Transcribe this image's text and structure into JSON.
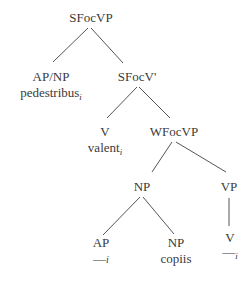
{
  "tree": {
    "root": {
      "label": "SFocVP"
    },
    "ap_np": {
      "label": "AP/NP",
      "word": "pedestribus",
      "index": "i"
    },
    "sfocv_bar": {
      "label": "SFocV'"
    },
    "v_upper": {
      "label": "V",
      "word": "valent",
      "index": "i"
    },
    "wfocvp": {
      "label": "WFocVP"
    },
    "np_mid": {
      "label": "NP"
    },
    "vp_right": {
      "label": "VP"
    },
    "ap_low": {
      "label": "AP",
      "trace": "—",
      "index": "i"
    },
    "np_low": {
      "label": "NP",
      "word": "copiis"
    },
    "v_low": {
      "label": "V",
      "trace": "—",
      "index": "i"
    }
  },
  "colors": {
    "line": "#555555",
    "text": "#3a3a3a"
  }
}
